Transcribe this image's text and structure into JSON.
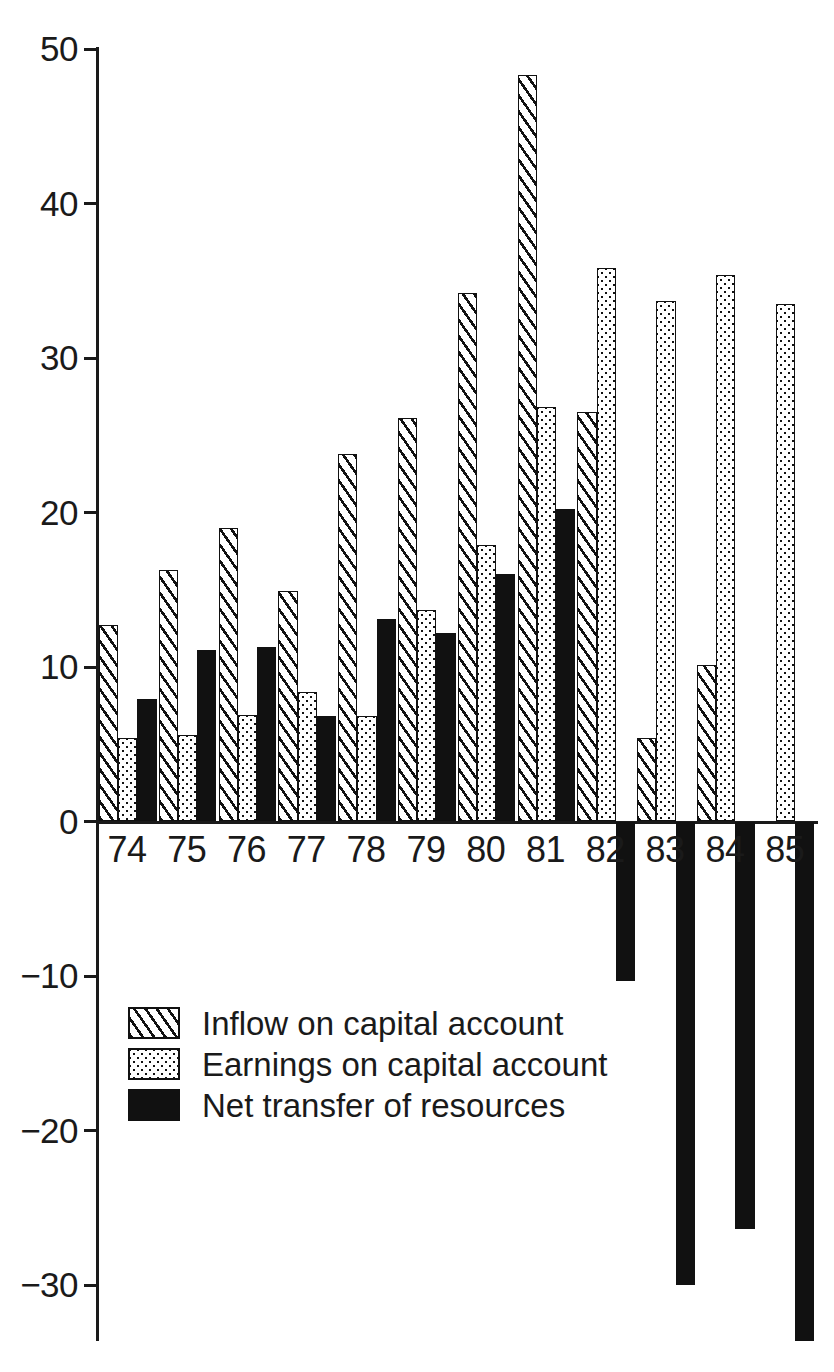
{
  "chart_data": {
    "type": "bar",
    "title": "",
    "subtitle": "",
    "xlabel": "",
    "ylabel": "",
    "grid": false,
    "legend_position": "inside-bottom-left",
    "categories": [
      "74",
      "75",
      "76",
      "77",
      "78",
      "79",
      "80",
      "81",
      "82",
      "83",
      "84",
      "85"
    ],
    "ylim": [
      -34,
      50
    ],
    "yticks": [
      50,
      40,
      30,
      20,
      10,
      0,
      -10,
      -20,
      -30
    ],
    "ytick_labels": [
      "50",
      "40",
      "30",
      "20",
      "10",
      "0",
      "−10",
      "−20",
      "−30"
    ],
    "series": [
      {
        "name": "Inflow on capital account",
        "fill": "hatch",
        "values": [
          12.7,
          16.3,
          19.0,
          14.9,
          23.8,
          26.1,
          34.2,
          48.3,
          26.5,
          5.4,
          10.1,
          0.0
        ]
      },
      {
        "name": "Earnings on capital account",
        "fill": "dots",
        "values": [
          5.4,
          5.6,
          6.9,
          8.4,
          6.8,
          13.7,
          17.9,
          26.8,
          35.8,
          33.7,
          35.4,
          33.5
        ]
      },
      {
        "name": "Net transfer of resources",
        "fill": "solid",
        "values": [
          7.9,
          11.1,
          11.3,
          6.8,
          13.1,
          12.2,
          16.0,
          20.2,
          -10.3,
          -30.0,
          -26.4,
          -33.6
        ]
      }
    ]
  },
  "legend": {
    "items": [
      {
        "label": "Inflow on capital account",
        "fill": "hatch"
      },
      {
        "label": "Earnings on capital account",
        "fill": "dots"
      },
      {
        "label": "Net transfer of resources",
        "fill": "solid"
      }
    ]
  },
  "colors": {
    "ink": "#111111",
    "background": "#ffffff"
  }
}
